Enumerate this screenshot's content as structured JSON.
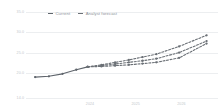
{
  "legend": {
    "items": [
      {
        "label": "Current",
        "style": "solid",
        "color": "#5f656c"
      },
      {
        "label": "Analyst forecast",
        "style": "dashed",
        "color": "#6b7076"
      }
    ]
  },
  "chart_data": {
    "type": "line",
    "title": "",
    "subtitle": "",
    "xlabel": "",
    "ylabel": "",
    "grid": true,
    "legend_position": "top-left",
    "xlim": [
      2022.6,
      2026.8
    ],
    "ylim": [
      14.0,
      35.0
    ],
    "x_tick_labels": [
      "2024",
      "2025",
      "2026"
    ],
    "x_tick_values": [
      2024,
      2025,
      2026
    ],
    "y_tick_labels": [
      "35.0",
      "30.0",
      "25.0",
      "20.0",
      "14.0"
    ],
    "y_tick_values": [
      35.0,
      30.0,
      25.0,
      20.0,
      14.0
    ],
    "series": [
      {
        "name": "Current",
        "style": "solid",
        "color": "#5f656c",
        "x": [
          2022.8,
          2023.1,
          2023.4,
          2023.7,
          2023.95
        ],
        "values": [
          19.1,
          19.3,
          19.9,
          20.9,
          21.6
        ]
      },
      {
        "name": "Analyst forecast high",
        "style": "dashed",
        "color": "#6b7076",
        "x": [
          2023.95,
          2024.25,
          2024.55,
          2024.85,
          2025.15,
          2025.45,
          2025.95,
          2026.55
        ],
        "values": [
          21.6,
          22.1,
          22.7,
          23.3,
          24.0,
          24.7,
          26.6,
          29.3
        ]
      },
      {
        "name": "Analyst forecast mid",
        "style": "dashed",
        "color": "#6b7076",
        "x": [
          2023.95,
          2024.25,
          2024.55,
          2024.85,
          2025.15,
          2025.45,
          2025.95,
          2026.55
        ],
        "values": [
          21.6,
          21.9,
          22.3,
          22.7,
          23.1,
          23.6,
          25.1,
          27.9
        ]
      },
      {
        "name": "Analyst forecast low",
        "style": "dashed",
        "color": "#6b7076",
        "x": [
          2023.95,
          2024.25,
          2024.55,
          2024.85,
          2025.15,
          2025.45,
          2025.95,
          2026.55
        ],
        "values": [
          21.6,
          21.7,
          21.9,
          22.1,
          22.4,
          22.7,
          23.8,
          27.3
        ]
      }
    ]
  }
}
